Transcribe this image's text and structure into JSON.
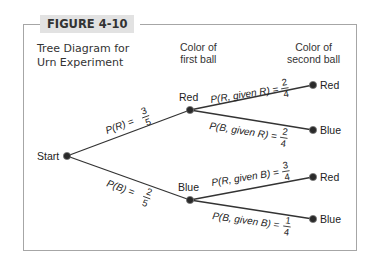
{
  "figure": {
    "label": "FIGURE 4-10",
    "title_line1": "Tree Diagram for",
    "title_line2": "Urn Experiment"
  },
  "headers": {
    "first_line1": "Color of",
    "first_line2": "first ball",
    "second_line1": "Color of",
    "second_line2": "second ball"
  },
  "nodes": {
    "start": "Start",
    "first_red": "Red",
    "first_blue": "Blue",
    "rr": "Red",
    "rb": "Blue",
    "br": "Red",
    "bb": "Blue"
  },
  "branches": {
    "pR": {
      "text": "P(R) =",
      "num": "3",
      "den": "5"
    },
    "pB": {
      "text": "P(B) =",
      "num": "2",
      "den": "5"
    },
    "pR_given_R": {
      "text": "P(R, given R) =",
      "num": "2",
      "den": "4"
    },
    "pB_given_R": {
      "text": "P(B, given R) =",
      "num": "2",
      "den": "4"
    },
    "pR_given_B": {
      "text": "P(R, given B) =",
      "num": "3",
      "den": "4"
    },
    "pB_given_B": {
      "text": "P(B, given B) =",
      "num": "1",
      "den": "4"
    }
  },
  "colors": {
    "frame": "#a6a6a6",
    "label_bg": "#e2e2e2",
    "line": "#333333",
    "node": "#2a2a2a"
  }
}
